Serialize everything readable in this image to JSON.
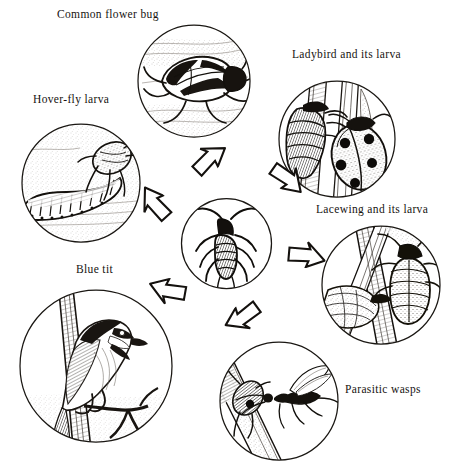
{
  "diagram": {
    "type": "cycle-diagram",
    "center": {
      "name": "aphid",
      "label": "",
      "circle": {
        "cx": 226,
        "cy": 243,
        "r": 46
      }
    },
    "nodes": [
      {
        "id": "common-flower-bug",
        "label": "Common flower bug",
        "label_pos": {
          "x": 57,
          "y": 8
        },
        "circle": {
          "cx": 193,
          "cy": 80,
          "r": 57
        },
        "icon": "flower-bug-illustration"
      },
      {
        "id": "ladybird",
        "label": "Ladybird and its larva",
        "label_pos": {
          "x": 292,
          "y": 48
        },
        "circle": {
          "cx": 336,
          "cy": 138,
          "r": 59
        },
        "icon": "ladybird-illustration"
      },
      {
        "id": "hover-fly-larva",
        "label": "Hover-fly larva",
        "label_pos": {
          "x": 33,
          "y": 93
        },
        "circle": {
          "cx": 80,
          "cy": 182,
          "r": 60
        },
        "icon": "hoverfly-larva-illustration"
      },
      {
        "id": "lacewing",
        "label": "Lacewing and its larva",
        "label_pos": {
          "x": 316,
          "y": 203
        },
        "circle": {
          "cx": 380,
          "cy": 284,
          "r": 60
        },
        "icon": "lacewing-illustration"
      },
      {
        "id": "blue-tit",
        "label": "Blue tit",
        "label_pos": {
          "x": 76,
          "y": 263
        },
        "circle": {
          "cx": 96,
          "cy": 365,
          "r": 78
        },
        "icon": "blue-tit-illustration"
      },
      {
        "id": "parasitic-wasps",
        "label": "Parasitic wasps",
        "label_pos": {
          "x": 345,
          "y": 383
        },
        "circle": {
          "cx": 278,
          "cy": 400,
          "r": 60
        },
        "icon": "parasitic-wasp-illustration"
      }
    ],
    "arrows": [
      {
        "id": "arrow-flower-bug-to-centre",
        "x": 188,
        "y": 144,
        "rotate": 135,
        "from": "common-flower-bug",
        "to": "aphid"
      },
      {
        "id": "arrow-ladybird-to-centre",
        "x": 268,
        "y": 163,
        "rotate": 215,
        "from": "ladybird",
        "to": "aphid"
      },
      {
        "id": "arrow-hoverfly-to-centre",
        "x": 134,
        "y": 191,
        "rotate": 48,
        "from": "hover-fly-larva",
        "to": "aphid"
      },
      {
        "id": "arrow-lacewing-to-centre",
        "x": 286,
        "y": 240,
        "rotate": 185,
        "from": "lacewing",
        "to": "aphid"
      },
      {
        "id": "arrow-blue-tit-to-centre",
        "x": 148,
        "y": 278,
        "rotate": 10,
        "from": "blue-tit",
        "to": "aphid"
      },
      {
        "id": "arrow-wasps-to-centre",
        "x": 224,
        "y": 304,
        "rotate": 324,
        "from": "parasitic-wasps",
        "to": "aphid"
      }
    ],
    "colors": {
      "ink": "#1a1713",
      "paper": "#ffffff",
      "stipple": "#6d6660"
    }
  }
}
